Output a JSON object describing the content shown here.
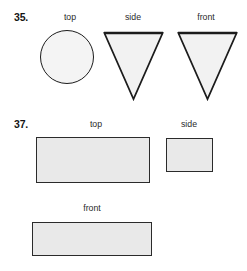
{
  "page": {
    "background_color": "#ffffff",
    "width": 247,
    "height": 271
  },
  "style_tokens": {
    "ink_color": "#1c1c1c",
    "outline_color": "#2b2b2b",
    "circle_fill": "#f4f4f4",
    "rect_fill": "#e9e9e9",
    "triangle_fill": "#f2f2f2",
    "caption_color": "#2a2a2a"
  },
  "problems": [
    {
      "number_label": "35.",
      "views": [
        {
          "caption": "top",
          "shape": "circle",
          "fill": "#f4f4f4",
          "geometry": {
            "x": 40,
            "y": 30,
            "width": 54,
            "height": 54
          }
        },
        {
          "caption": "side",
          "shape": "triangle-down",
          "fill": "#f2f2f2",
          "geometry": {
            "x": 103,
            "y": 32,
            "width": 60,
            "height": 68
          }
        },
        {
          "caption": "front",
          "shape": "triangle-down",
          "fill": "#f2f2f2",
          "geometry": {
            "x": 177,
            "y": 32,
            "width": 60,
            "height": 68
          }
        }
      ]
    },
    {
      "number_label": "37.",
      "views": [
        {
          "caption": "top",
          "shape": "rectangle",
          "fill": "#e9e9e9",
          "geometry": {
            "x": 36,
            "y": 137,
            "width": 114,
            "height": 46
          }
        },
        {
          "caption": "side",
          "shape": "rectangle",
          "fill": "#e9e9e9",
          "geometry": {
            "x": 166,
            "y": 138,
            "width": 47,
            "height": 34
          }
        },
        {
          "caption": "front",
          "shape": "rectangle",
          "fill": "#e9e9e9",
          "geometry": {
            "x": 32,
            "y": 222,
            "width": 120,
            "height": 34
          }
        }
      ]
    }
  ],
  "labels": {
    "p35_number": "35.",
    "p35_top": "top",
    "p35_side": "side",
    "p35_front": "front",
    "p37_number": "37.",
    "p37_top": "top",
    "p37_side": "side",
    "p37_front": "front"
  }
}
